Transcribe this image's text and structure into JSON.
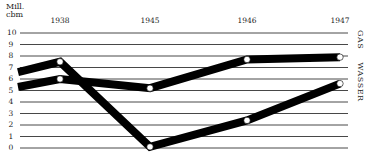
{
  "chart_data": {
    "type": "line",
    "title": "",
    "ylabel": "Mill. cbm",
    "xlabel": "",
    "ylim": [
      0,
      10
    ],
    "yticks": [
      0,
      1,
      2,
      3,
      4,
      5,
      6,
      7,
      8,
      9,
      10
    ],
    "categories": [
      "",
      "1938",
      "1945",
      "1946",
      "1947"
    ],
    "grid": true,
    "legend_position": "right (vertical text)",
    "series": [
      {
        "name": "WASSER",
        "values": [
          5.3,
          6.0,
          5.2,
          7.7,
          7.9
        ]
      },
      {
        "name": "GAS",
        "values": [
          6.6,
          7.5,
          0.1,
          2.4,
          5.6
        ]
      }
    ]
  },
  "axis": {
    "unit_line1": "Mill.",
    "unit_line2": "cbm",
    "yticks": [
      "10",
      "9",
      "8",
      "7",
      "6",
      "5",
      "4",
      "3",
      "2",
      "1",
      "0"
    ],
    "xticks": [
      "1938",
      "1945",
      "1946",
      "1947"
    ]
  },
  "legend": {
    "gas": "GAS",
    "wasser": "WASSER"
  },
  "colors": {
    "line": "#000000",
    "grid": "#333333",
    "marker": "#ffffff"
  }
}
